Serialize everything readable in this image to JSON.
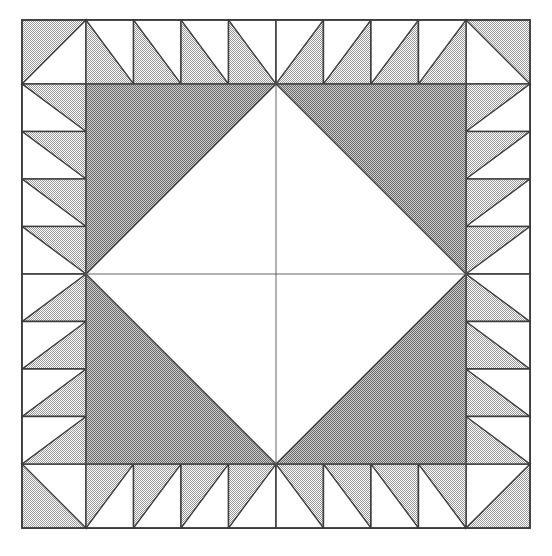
{
  "figure": {
    "title": "Quilt Block Pattern",
    "kind": "geometric-quilt-block"
  },
  "canvas": {
    "width": 552,
    "height": 556,
    "background": "#ffffff",
    "margin_left": 22,
    "margin_top": 20
  },
  "colors": {
    "background": "#ffffff",
    "patch_white": "#ffffff",
    "border_gray": "#c3c3c3",
    "field_gray": "#a9a9a9",
    "outline": "#3c3c3c",
    "hairline": "#555555"
  },
  "geometry": {
    "block_x": 22,
    "block_y": 20,
    "block_size": 508,
    "border_band": 64,
    "field_x": 86,
    "field_y": 84,
    "field_size": 380,
    "center_x": 276,
    "center_y": 274,
    "border_cells_per_side": 8,
    "cell_size": 63.5,
    "outline_width": 1.4,
    "hairline_width": 0.9
  },
  "structure": {
    "outer_frame_label": "outer block frame",
    "border_label": "sawtooth border band",
    "field_label": "inner field square",
    "diamond_label": "central white diamond",
    "corner_label": "corner triangle",
    "center_lines_label": "center seam lines"
  },
  "symmetry": {
    "axes": "vertical and horizontal mirror through center",
    "fold": 4
  },
  "patches": {
    "border_corner_squares": 4,
    "border_half_square_triangles": 28,
    "field_corner_triangles": 4,
    "center_diamond_quarters": 4
  }
}
